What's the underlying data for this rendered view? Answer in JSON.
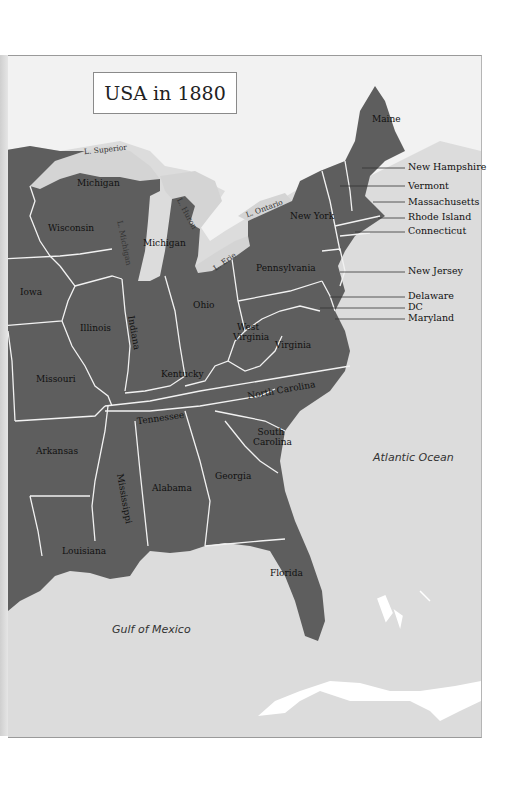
{
  "title": "USA in 1880",
  "colors": {
    "land": "#5e5e5e",
    "water": "#dcdcdc",
    "lakes": "#d8d8d8",
    "foreign_land": "#f2f2f2",
    "borders": "#f0f0f0",
    "text": "#111111"
  },
  "states": [
    {
      "name": "Maine"
    },
    {
      "name": "New York"
    },
    {
      "name": "Michigan",
      "note": "upper peninsula"
    },
    {
      "name": "Michigan",
      "note": "lower peninsula"
    },
    {
      "name": "Wisconsin"
    },
    {
      "name": "Pennsylvania"
    },
    {
      "name": "Iowa"
    },
    {
      "name": "Illinois"
    },
    {
      "name": "Indiana"
    },
    {
      "name": "Ohio"
    },
    {
      "name": "West Virginia"
    },
    {
      "name": "Virginia"
    },
    {
      "name": "Missouri"
    },
    {
      "name": "Kentucky"
    },
    {
      "name": "Tennessee"
    },
    {
      "name": "North Carolina"
    },
    {
      "name": "Arkansas"
    },
    {
      "name": "South Carolina"
    },
    {
      "name": "Mississippi"
    },
    {
      "name": "Alabama"
    },
    {
      "name": "Georgia"
    },
    {
      "name": "Louisiana"
    },
    {
      "name": "Florida"
    }
  ],
  "callouts": [
    {
      "name": "New Hampshire"
    },
    {
      "name": "Vermont"
    },
    {
      "name": "Massachusetts"
    },
    {
      "name": "Rhode Island"
    },
    {
      "name": "Connecticut"
    },
    {
      "name": "New Jersey"
    },
    {
      "name": "Delaware"
    },
    {
      "name": "DC"
    },
    {
      "name": "Maryland"
    }
  ],
  "lakes": [
    {
      "name": "L. Superior"
    },
    {
      "name": "L. Michigan"
    },
    {
      "name": "L. Huron"
    },
    {
      "name": "L. Erie"
    },
    {
      "name": "L. Ontario"
    }
  ],
  "water_bodies": [
    {
      "name": "Atlantic Ocean"
    },
    {
      "name": "Gulf of Mexico"
    }
  ]
}
